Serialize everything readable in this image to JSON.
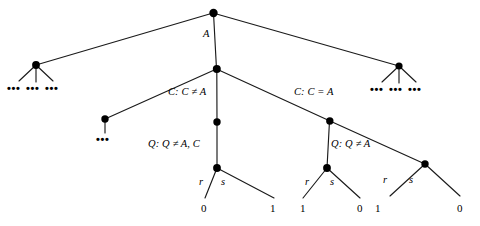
{
  "figure": {
    "type": "decision-tree-diagram",
    "background_color": "#ffffff",
    "line_color": "#1a1a1a",
    "node_color": "#000000"
  },
  "labels": {
    "root_branch": "A",
    "c_not_equal_a": "C: C ≠ A",
    "c_equal_a": "C: C = A",
    "q_not_equal_a_c": "Q: Q ≠ A, C",
    "q_not_equal_a": "Q: Q ≠ A",
    "ellipsis": "•••"
  },
  "leaf_groups": [
    {
      "id": "group-left",
      "left_branch_label": "r",
      "right_branch_label": "s",
      "left_leaf_value": "0",
      "right_leaf_value": "1"
    },
    {
      "id": "group-middle",
      "left_branch_label": "r",
      "right_branch_label": "s",
      "left_leaf_value": "1",
      "right_leaf_value": "0"
    },
    {
      "id": "group-right",
      "left_branch_label": "r",
      "right_branch_label": "s",
      "left_leaf_value": "1",
      "right_leaf_value": "0"
    }
  ],
  "fan_subtrees": {
    "left": [
      "•••",
      "•••",
      "•••"
    ],
    "right": [
      "•••",
      "•••",
      "•••"
    ]
  },
  "stub_subtree": {
    "label": "•••"
  }
}
